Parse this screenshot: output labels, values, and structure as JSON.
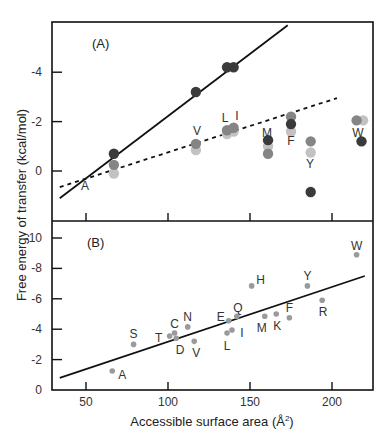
{
  "chart_data": [
    {
      "type": "scatter",
      "panel": "(A)",
      "title": "",
      "xlabel": "Accessible surface area (Å²)",
      "ylabel": "Free energy of transfer (kcal/mol)",
      "x_ticks": [
        50,
        100,
        150,
        200
      ],
      "y_ticks": [
        "-4",
        "-2",
        "0"
      ],
      "xlim": [
        32,
        222
      ],
      "ylim_display_top_to_bottom": [
        -6,
        1.3
      ],
      "series": [
        {
          "name": "dark",
          "color": "#3a3a3a",
          "points": [
            {
              "label": "A",
              "x": 67,
              "y": -0.7
            },
            {
              "label": "V",
              "x": 117,
              "y": -3.2
            },
            {
              "label": "L",
              "x": 136,
              "y": -4.2
            },
            {
              "label": "I",
              "x": 140,
              "y": -4.2
            },
            {
              "label": "M",
              "x": 161,
              "y": -1.25
            },
            {
              "label": "F",
              "x": 175,
              "y": -1.9
            },
            {
              "label": "Y",
              "x": 187,
              "y": 0.85
            },
            {
              "label": "W",
              "x": 218,
              "y": -1.2
            }
          ]
        },
        {
          "name": "medium",
          "color": "#858585",
          "points": [
            {
              "label": "A",
              "x": 67,
              "y": -0.25
            },
            {
              "label": "V",
              "x": 117,
              "y": -1.1
            },
            {
              "label": "L",
              "x": 136,
              "y": -1.65
            },
            {
              "label": "I",
              "x": 140,
              "y": -1.75
            },
            {
              "label": "M",
              "x": 161,
              "y": -0.7
            },
            {
              "label": "F",
              "x": 175,
              "y": -2.2
            },
            {
              "label": "Y",
              "x": 187,
              "y": -1.2
            },
            {
              "label": "W",
              "x": 215,
              "y": -2.05
            }
          ]
        },
        {
          "name": "light",
          "color": "#c2c2c2",
          "points": [
            {
              "label": "A",
              "x": 67,
              "y": 0.1
            },
            {
              "label": "V",
              "x": 117,
              "y": -0.85
            },
            {
              "label": "L",
              "x": 136,
              "y": -1.5
            },
            {
              "label": "I",
              "x": 140,
              "y": -1.6
            },
            {
              "label": "M",
              "x": 161,
              "y": -1.0
            },
            {
              "label": "F",
              "x": 175,
              "y": -1.6
            },
            {
              "label": "Y",
              "x": 187,
              "y": -0.75
            },
            {
              "label": "W",
              "x": 219,
              "y": -2.05
            }
          ]
        }
      ],
      "fit_lines": [
        {
          "style": "solid",
          "from": [
            34,
            1.1
          ],
          "to": [
            173,
            -5.9
          ]
        },
        {
          "style": "dashed",
          "from": [
            34,
            0.65
          ],
          "to": [
            203,
            -2.95
          ]
        }
      ]
    },
    {
      "type": "scatter",
      "panel": "(B)",
      "title": "",
      "xlabel": "Accessible surface area (Å²)",
      "ylabel": "Free energy of transfer (kcal/mol)",
      "x_ticks": [
        50,
        100,
        150,
        200
      ],
      "y_ticks": [
        "-10",
        "-8",
        "-6",
        "-4",
        "-2",
        "0"
      ],
      "xlim": [
        32,
        222
      ],
      "ylim_display_top_to_bottom": [
        -11,
        0
      ],
      "series": [
        {
          "name": "amino acids",
          "color": "#9a9a9a",
          "points": [
            {
              "label": "A",
              "x": 66,
              "y": -1.25
            },
            {
              "label": "S",
              "x": 79,
              "y": -3.0
            },
            {
              "label": "T",
              "x": 101,
              "y": -3.55
            },
            {
              "label": "C",
              "x": 104,
              "y": -3.75
            },
            {
              "label": "D",
              "x": 105,
              "y": -3.4
            },
            {
              "label": "N",
              "x": 112,
              "y": -4.15
            },
            {
              "label": "V",
              "x": 116,
              "y": -3.2
            },
            {
              "label": "L",
              "x": 136,
              "y": -3.75
            },
            {
              "label": "E",
              "x": 137,
              "y": -4.55
            },
            {
              "label": "I",
              "x": 139,
              "y": -3.95
            },
            {
              "label": "Q",
              "x": 142,
              "y": -4.85
            },
            {
              "label": "H",
              "x": 151,
              "y": -6.85
            },
            {
              "label": "M",
              "x": 159,
              "y": -4.85
            },
            {
              "label": "K",
              "x": 166,
              "y": -5.0
            },
            {
              "label": "F",
              "x": 174,
              "y": -4.75
            },
            {
              "label": "Y",
              "x": 185,
              "y": -6.85
            },
            {
              "label": "R",
              "x": 194,
              "y": -5.9
            },
            {
              "label": "W",
              "x": 215,
              "y": -8.9
            }
          ]
        }
      ],
      "fit_lines": [
        {
          "style": "solid",
          "from": [
            34,
            -0.8
          ],
          "to": [
            220,
            -7.5
          ]
        }
      ]
    }
  ],
  "labels": {
    "panel_a": "(A)",
    "panel_b": "(B)",
    "y_axis_title": "Free energy of transfer  (kcal/mol)",
    "x_axis_title_main": "Accessible surface area (Å",
    "x_axis_title_sup": "2",
    "x_axis_title_end": ")"
  }
}
